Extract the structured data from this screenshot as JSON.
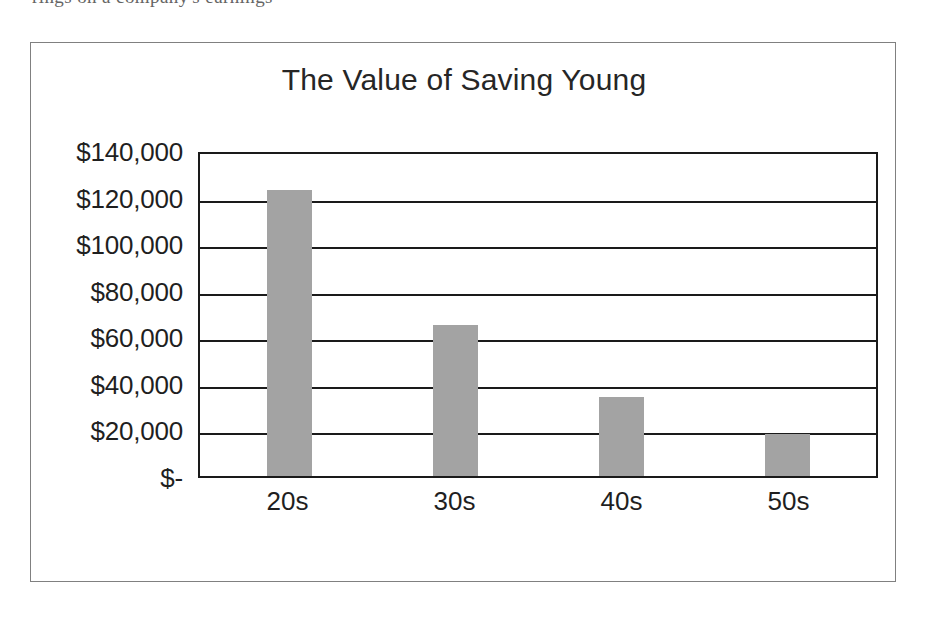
{
  "page": {
    "clipped_header_text": "rings on a company's earnings"
  },
  "chart_data": {
    "type": "bar",
    "title": "The Value of Saving Young",
    "xlabel": "",
    "ylabel": "",
    "categories": [
      "20s",
      "30s",
      "40s",
      "50s"
    ],
    "values": [
      123000,
      65000,
      34000,
      18000
    ],
    "ylim": [
      0,
      140000
    ],
    "ytick_values": [
      140000,
      120000,
      100000,
      80000,
      60000,
      40000,
      20000,
      0
    ],
    "ytick_labels": [
      "$140,000",
      "$120,000",
      "$100,000",
      "$80,000",
      "$60,000",
      "$40,000",
      "$20,000",
      "$-"
    ],
    "grid": true,
    "legend": false,
    "legend_position": "none",
    "series": [
      {
        "name": "Value at retirement",
        "values": [
          123000,
          65000,
          34000,
          18000
        ]
      }
    ],
    "colors": {
      "bar_fill": "#a3a3a3",
      "axis_line": "#1a1a1a",
      "gridline": "#1a1a1a",
      "frame_border": "#808080",
      "title_text": "#262626",
      "tick_text": "#1f1f1f",
      "plot_background": "#ffffff"
    }
  }
}
